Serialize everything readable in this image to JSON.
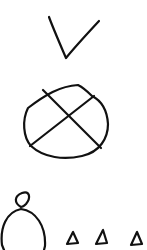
{
  "canvas": {
    "width": 147,
    "height": 250,
    "background": "#ffffff"
  },
  "stroke": {
    "color": "#111111",
    "width": 2.2
  },
  "sketches": [
    {
      "name": "checkmark",
      "description": "hand-drawn check mark"
    },
    {
      "name": "crossed-circle",
      "description": "hand-drawn circle with an X through it"
    },
    {
      "name": "figure-with-head",
      "description": "large circle with a small loop on top"
    },
    {
      "name": "triangles",
      "count": 3,
      "description": "three small hand-drawn triangles"
    }
  ]
}
